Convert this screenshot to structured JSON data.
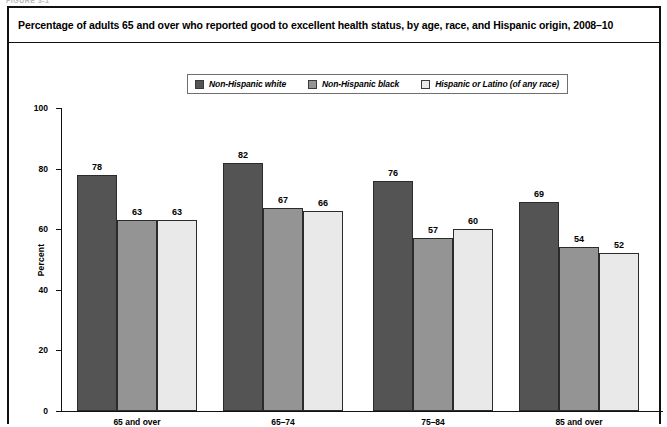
{
  "figure_slug": "FIGURE 3-1",
  "title": "Percentage of adults 65 and over who reported good to excellent health status, by age, race, and Hispanic origin, 2008–10",
  "colors": {
    "series_1": "#545454",
    "series_2": "#949494",
    "series_3": "#e9e9e9",
    "axis": "#111111",
    "border": "#111111"
  },
  "legend": {
    "position": "top-center",
    "items": [
      {
        "label": "Non-Hispanic white",
        "swatch": "#545454",
        "icon": "legend-swatch-icon"
      },
      {
        "label": "Non-Hispanic black",
        "swatch": "#949494",
        "icon": "legend-swatch-icon"
      },
      {
        "label": "Hispanic or Latino (of any race)",
        "swatch": "#e9e9e9",
        "icon": "legend-swatch-icon"
      }
    ]
  },
  "chart_data": {
    "type": "bar",
    "title": "Percentage of adults 65 and over who reported good to excellent health status, by age, race, and Hispanic origin, 2008–10",
    "xlabel": "",
    "ylabel": "Percent",
    "ylim": [
      0,
      100
    ],
    "yticks": [
      0,
      20,
      40,
      60,
      80,
      100
    ],
    "ytick_labels": [
      "0",
      "20",
      "40",
      "60",
      "80",
      "100"
    ],
    "grid": false,
    "legend_position": "top-center",
    "categories": [
      "65 and over",
      "65–74",
      "75–84",
      "85 and over"
    ],
    "series": [
      {
        "name": "Non-Hispanic white",
        "values": [
          78,
          82,
          76,
          69
        ]
      },
      {
        "name": "Non-Hispanic black",
        "values": [
          63,
          67,
          57,
          54
        ]
      },
      {
        "name": "Hispanic or Latino (of any race)",
        "values": [
          63,
          66,
          60,
          52
        ]
      }
    ]
  }
}
